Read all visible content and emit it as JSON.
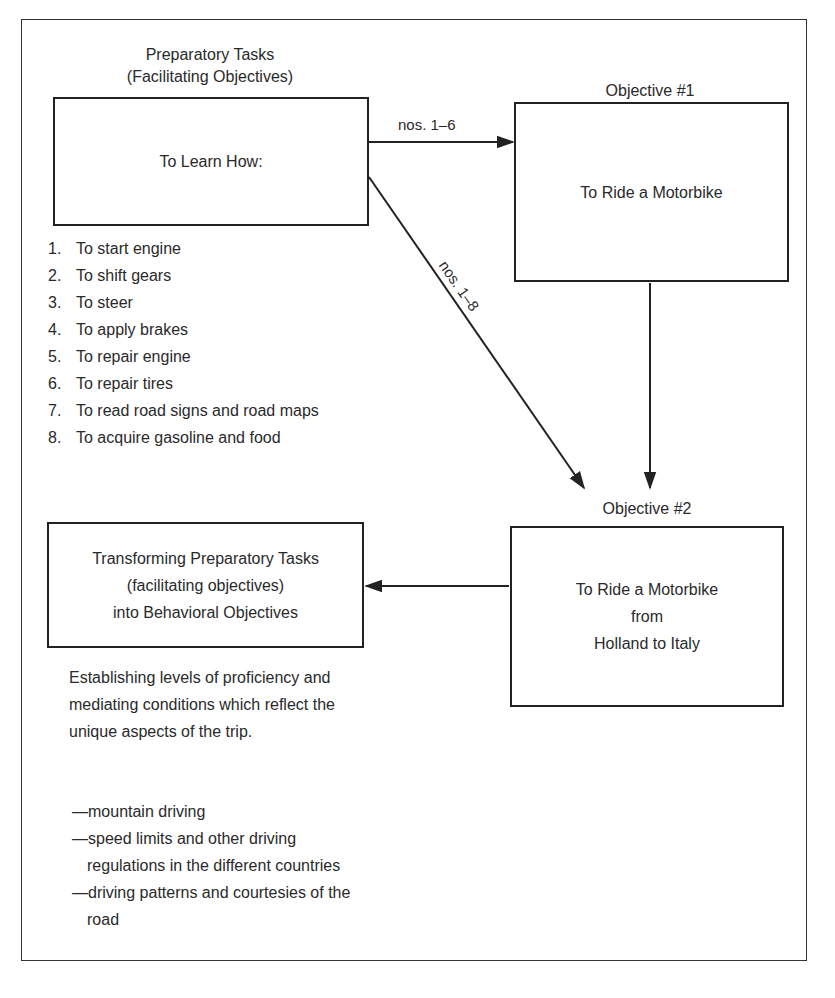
{
  "diagram": {
    "preparatory": {
      "heading_line1": "Preparatory Tasks",
      "heading_line2": "(Facilitating Objectives)",
      "box_text": "To Learn How:",
      "tasks": [
        {
          "num": "1.",
          "text": "To start engine"
        },
        {
          "num": "2.",
          "text": "To shift gears"
        },
        {
          "num": "3.",
          "text": "To steer"
        },
        {
          "num": "4.",
          "text": "To apply brakes"
        },
        {
          "num": "5.",
          "text": "To repair engine"
        },
        {
          "num": "6.",
          "text": "To repair tires"
        },
        {
          "num": "7.",
          "text": "To read road signs and road maps"
        },
        {
          "num": "8.",
          "text": "To acquire gasoline and food"
        }
      ]
    },
    "objective1": {
      "heading": "Objective #1",
      "box_text": "To Ride a Motorbike"
    },
    "objective2": {
      "heading": "Objective #2",
      "box_line1": "To Ride a Motorbike",
      "box_line2": "from",
      "box_line3": "Holland to Italy"
    },
    "transform": {
      "box_line1": "Transforming Preparatory Tasks",
      "box_line2": "(facilitating objectives)",
      "box_line3": "into Behavioral Objectives",
      "paragraph": "Establishing levels of proficiency and mediating conditions which reflect the unique aspects of the trip.",
      "bullets": [
        "—mountain driving",
        "—speed limits and other driving regulations in the different countries",
        "—driving patterns and courtesies of the road"
      ]
    },
    "edges": {
      "prep_to_obj1": "nos. 1–6",
      "prep_to_obj2": "nos. 1–8"
    },
    "colors": {
      "line": "#222222",
      "text": "#2a2a2a",
      "background": "#ffffff"
    }
  }
}
